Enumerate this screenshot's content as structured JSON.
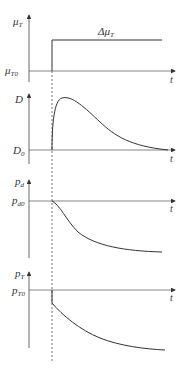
{
  "diagram": {
    "type": "timing-response",
    "line_color": "#333333",
    "axis_color": "#555555",
    "panels": [
      {
        "id": "muT",
        "y_label": "μ",
        "y_label_sub": "T",
        "baseline_label": "μ",
        "baseline_label_sub": "T0",
        "x_label": "t",
        "annotation": "Δμ",
        "annotation_sub": "T",
        "shape": "step"
      },
      {
        "id": "D",
        "y_label": "D",
        "y_label_sub": "",
        "baseline_label": "D",
        "baseline_label_sub": "0",
        "x_label": "t",
        "shape": "rise-then-decay"
      },
      {
        "id": "pd",
        "y_label": "p",
        "y_label_sub": "d",
        "baseline_label": "p",
        "baseline_label_sub": "d0",
        "x_label": "t",
        "shape": "smooth-decline"
      },
      {
        "id": "pT",
        "y_label": "p",
        "y_label_sub": "T",
        "baseline_label": "p",
        "baseline_label_sub": "T0",
        "x_label": "t",
        "shape": "drop-then-decline"
      }
    ]
  }
}
